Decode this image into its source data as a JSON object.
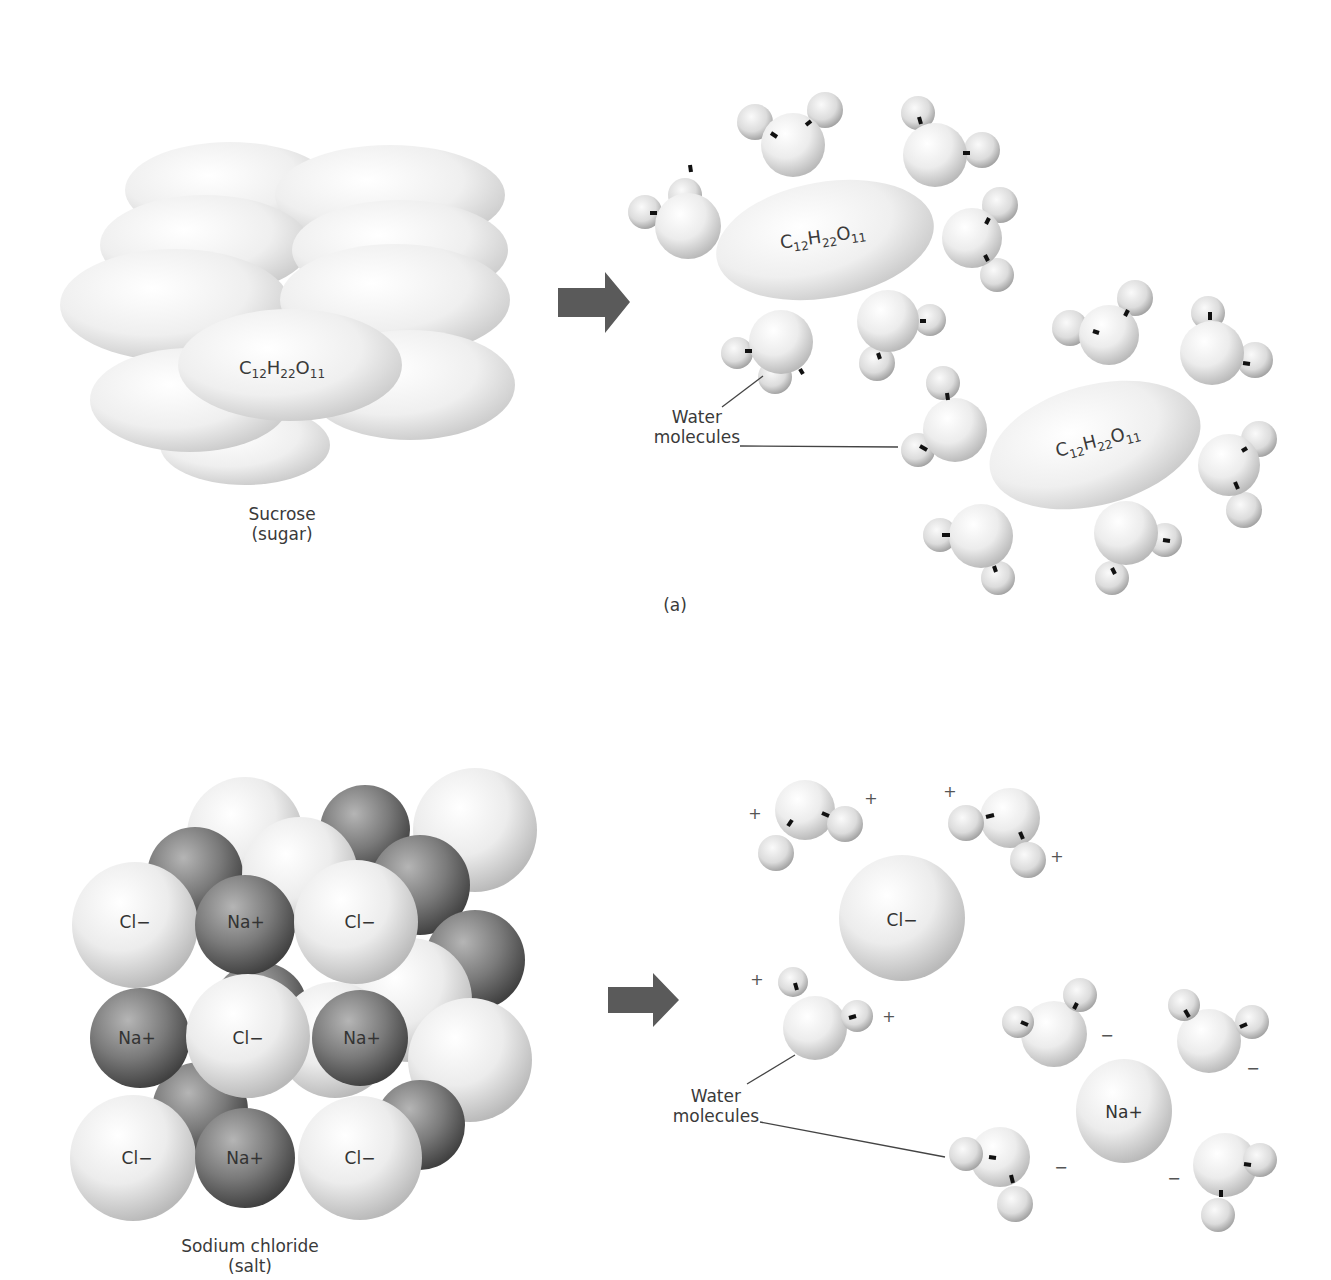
{
  "panel_a": {
    "caption": "(a)",
    "solid": {
      "formula": {
        "element1": "C",
        "sub1": "12",
        "element2": "H",
        "sub2": "22",
        "element3": "O",
        "sub3": "11"
      },
      "label_line1": "Sucrose",
      "label_line2": "(sugar)"
    },
    "arrow_icon": "right-arrow",
    "solution": {
      "molecule_1_formula": {
        "element1": "C",
        "sub1": "12",
        "element2": "H",
        "sub2": "22",
        "element3": "O",
        "sub3": "11"
      },
      "molecule_2_formula": {
        "element1": "C",
        "sub1": "12",
        "element2": "H",
        "sub2": "22",
        "element3": "O",
        "sub3": "11"
      },
      "water_label_line1": "Water",
      "water_label_line2": "molecules"
    }
  },
  "panel_b": {
    "solid": {
      "ions": [
        {
          "label": "Cl−"
        },
        {
          "label": "Na+"
        },
        {
          "label": "Cl−"
        },
        {
          "label": "Na+"
        },
        {
          "label": "Cl−"
        },
        {
          "label": "Na+"
        },
        {
          "label": "Cl−"
        },
        {
          "label": "Na+"
        },
        {
          "label": "Cl−"
        }
      ],
      "label_line1": "Sodium chloride",
      "label_line2": "(salt)"
    },
    "arrow_icon": "right-arrow",
    "solution": {
      "chloride_ion": "Cl−",
      "sodium_ion": "Na+",
      "positive_sign": "+",
      "negative_sign": "−",
      "water_label_line1": "Water",
      "water_label_line2": "molecules"
    }
  },
  "colors": {
    "background": "#ffffff",
    "arrow": "#5a5a5a",
    "sphere_light": "#f4f4f4",
    "sphere_dark": "#6e6e6e",
    "bond": "#111111",
    "text": "#3a3a3a"
  }
}
